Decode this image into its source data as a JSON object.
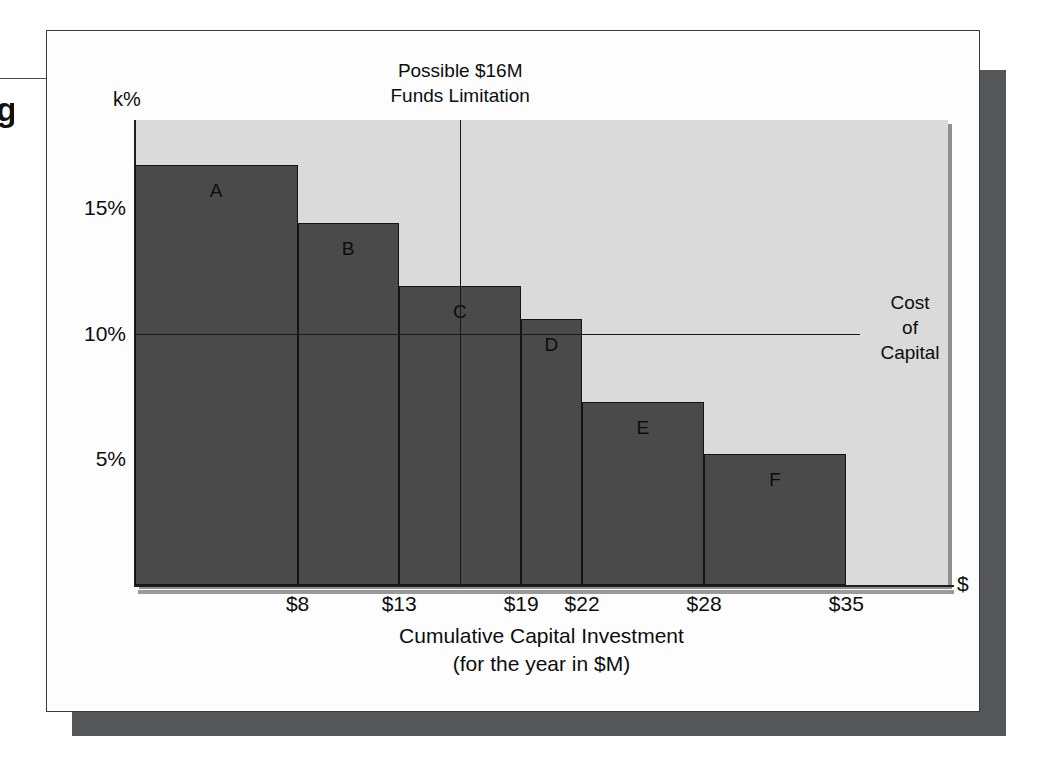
{
  "chart_data": {
    "type": "bar",
    "title": "",
    "xlabel": "Cumulative Capital Investment (for the year in $M)",
    "xlabel_line1": "Cumulative Capital Investment",
    "xlabel_line2": "(for the year in $M)",
    "ylabel": "k%",
    "x_axis_end_label": "$",
    "xlim": [
      0,
      40
    ],
    "ylim": [
      0,
      18.5
    ],
    "grid": false,
    "legend": "none",
    "y_ticks": [
      "5%",
      "10%",
      "15%"
    ],
    "y_tick_values": [
      5,
      10,
      15
    ],
    "x_ticks": [
      "$8",
      "$13",
      "$19",
      "$22",
      "$28",
      "$35"
    ],
    "x_tick_values": [
      8,
      13,
      19,
      22,
      28,
      35
    ],
    "categories": [
      "A",
      "B",
      "C",
      "D",
      "E",
      "F"
    ],
    "values": [
      16.7,
      14.4,
      11.9,
      10.6,
      7.3,
      5.2
    ],
    "bars": [
      {
        "label": "A",
        "rate_percent": 16.7,
        "cum_start": 0,
        "cum_end": 8
      },
      {
        "label": "B",
        "rate_percent": 14.4,
        "cum_start": 8,
        "cum_end": 13
      },
      {
        "label": "C",
        "rate_percent": 11.9,
        "cum_start": 13,
        "cum_end": 19
      },
      {
        "label": "D",
        "rate_percent": 10.6,
        "cum_start": 19,
        "cum_end": 22
      },
      {
        "label": "E",
        "rate_percent": 7.3,
        "cum_start": 22,
        "cum_end": 28
      },
      {
        "label": "F",
        "rate_percent": 5.2,
        "cum_start": 28,
        "cum_end": 35
      }
    ],
    "annotations": [
      {
        "name": "funds-limitation",
        "text_line1": "Possible $16M",
        "text_line2": "Funds Limitation",
        "x_value": 16,
        "orientation": "vertical"
      },
      {
        "name": "cost-of-capital",
        "text_line1": "Cost",
        "text_line2": "of",
        "text_line3": "Capital",
        "y_value": 10,
        "orientation": "horizontal"
      }
    ],
    "colors": {
      "bar_fill": "#4a4a4a",
      "bar_stroke": "#141414",
      "plot_background": "#d9dad9",
      "card_background": "#fdfdfd",
      "shadow": "#54565a",
      "axis": "#1d1d1d",
      "text": "#0d0d0d"
    }
  },
  "bleed": {
    "glyph": "g"
  }
}
